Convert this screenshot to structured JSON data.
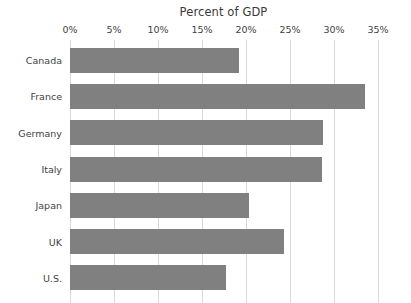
{
  "chart_data": {
    "type": "bar",
    "orientation": "horizontal",
    "title": "Percent of GDP",
    "xlabel": "",
    "ylabel": "",
    "categories": [
      "Canada",
      "France",
      "Germany",
      "Italy",
      "Japan",
      "UK",
      "U.S."
    ],
    "values": [
      19.2,
      33.5,
      28.7,
      28.6,
      20.3,
      24.3,
      17.7
    ],
    "series": [
      {
        "name": "Percent of GDP",
        "values": [
          19.2,
          33.5,
          28.7,
          28.6,
          20.3,
          24.3,
          17.7
        ]
      }
    ],
    "xlim": [
      0,
      35
    ],
    "xticks": [
      0,
      5,
      10,
      15,
      20,
      25,
      30,
      35
    ],
    "xtick_labels": [
      "0%",
      "5%",
      "10%",
      "15%",
      "20%",
      "25%",
      "30%",
      "35%"
    ],
    "grid": true,
    "grid_axis": "x",
    "legend": false,
    "legend_position": "none",
    "bar_color": "#808080",
    "grid_color": "#d9d9d9",
    "text_color": "#3f3f3f",
    "background_color": "#ffffff"
  }
}
